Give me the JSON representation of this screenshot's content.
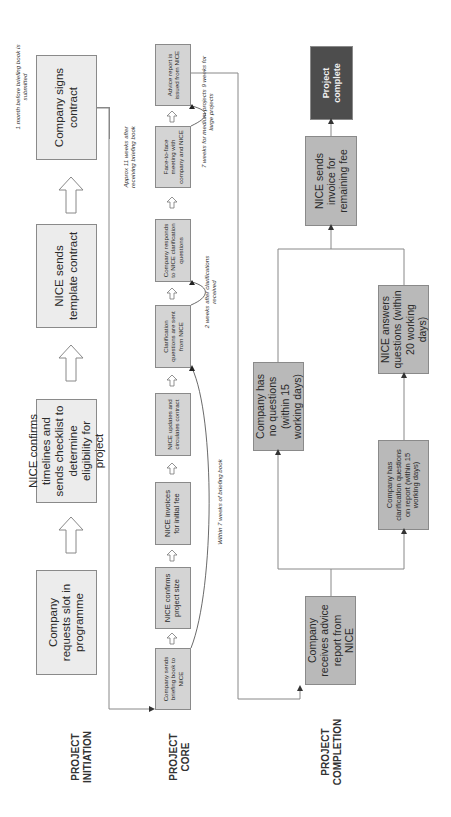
{
  "phases": {
    "initiation": "PROJECT INITIATION",
    "core": "PROJECT CORE",
    "completion": "PROJECT COMPLETION"
  },
  "initiation": {
    "steps": [
      "Company requests slot in programme",
      "NICE confirms timelines and sends checklist to determine eligibility for project",
      "NICE sends template contract",
      "Company signs contract"
    ],
    "note": "1 month before briefing book is submitted"
  },
  "core": {
    "steps": [
      "Company sends briefing book to NICE",
      "NICE confirms project size",
      "NICE invoices for initial fee",
      "NICE updates and circulates contract",
      "Clarification questions are sent from NICE",
      "Company responds to NICE clarification questions",
      "Face-to-face meeting with company and NICE",
      "Advice report is issued from NICE"
    ],
    "notes": {
      "within_7_weeks": "Within 7 weeks of briefing book",
      "two_weeks": "2 weeks after clarifications received",
      "approx_11_weeks": "Approx 11 weeks after receiving briefing book",
      "seven_nine_weeks": "7 weeks for medium projects 9 weeks for large projects"
    }
  },
  "completion": {
    "receives": "Company receives advice report from NICE",
    "no_questions": "Company has no questions (within 15 working days)",
    "has_questions": "Company has clarification questions on report (within 15 working days)",
    "nice_answers": "NICE answers questions (within 20 working days)",
    "invoice_remaining": "NICE sends invoice for remaining fee",
    "complete": "Project complete"
  },
  "colors": {
    "initiation_box": "#ececec",
    "core_box": "#d4d4d4",
    "completion_box": "#b9b9b9",
    "complete_box": "#4d4d4d",
    "line": "#888888"
  }
}
